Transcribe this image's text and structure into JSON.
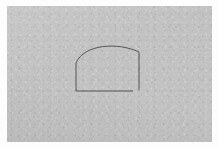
{
  "canvas": {
    "width": 219,
    "height": 148,
    "page_background_color": "#fdfdfd",
    "surface_color": "#c2c2c2",
    "surface_texture": "granular-noise",
    "surface_edge": "soft-feathered",
    "surface_rect": {
      "x": 7,
      "y": 6,
      "width": 205,
      "height": 136
    },
    "title": "",
    "annotations": []
  },
  "drawing": {
    "name": "arch-outline-sketch",
    "description": "Open line drawing of an arched form: a vertical left wall, a rounded arc sweeping up and over to the right, a vertical right wall, and a horizontal base line that stops short of the right wall.",
    "stroke_color": "#555555",
    "stroke_width": 1,
    "stroke_linecap": "butt",
    "fill": "none",
    "strokes": [
      {
        "name": "left-wall-stroke",
        "type": "line",
        "x1": 76,
        "y1": 63,
        "x2": 76,
        "y2": 91
      },
      {
        "name": "arch-curve-stroke",
        "type": "curve",
        "start": {
          "x": 76,
          "y": 63
        },
        "control_1": {
          "x": 84,
          "y": 44
        },
        "control_2": {
          "x": 118,
          "y": 42
        },
        "end": {
          "x": 139,
          "y": 52
        }
      },
      {
        "name": "right-wall-stroke",
        "type": "line",
        "x1": 139,
        "y1": 52,
        "x2": 139,
        "y2": 90
      },
      {
        "name": "base-line-stroke",
        "type": "line",
        "x1": 76,
        "y1": 91,
        "x2": 133,
        "y2": 91
      }
    ],
    "open_gap": {
      "name": "base-right-gap",
      "between": [
        "base-line-stroke",
        "right-wall-stroke"
      ],
      "from": {
        "x": 133,
        "y": 91
      },
      "to": {
        "x": 139,
        "y": 91
      }
    }
  }
}
